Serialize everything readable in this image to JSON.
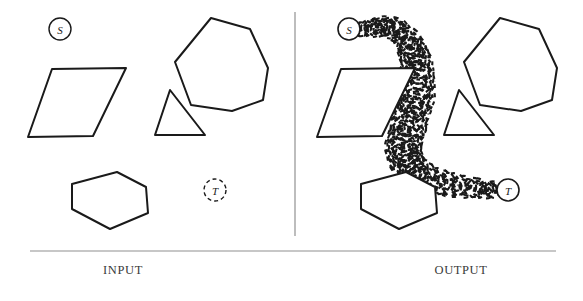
{
  "figure": {
    "background_color": "#ffffff",
    "stroke_color": "#1a1a1a",
    "divider_color": "#9a9a9a",
    "caption_color": "#3a3a3a",
    "width": 583,
    "height": 301
  },
  "panels": [
    {
      "id": "input",
      "caption": "INPUT",
      "caption_x": 123,
      "caption_y": 263,
      "start_marker": {
        "label": "S",
        "cx": 60,
        "cy": 29,
        "r": 11,
        "dashed": false
      },
      "goal_marker": {
        "label": "T",
        "cx": 215,
        "cy": 190,
        "r": 11,
        "dashed": true
      },
      "obstacles": [
        {
          "name": "parallelogram",
          "points": "52,69 126,68 93,136 28,137"
        },
        {
          "name": "heptagon",
          "points": "211,18 250,29 268,68 263,100 232,111 191,105 175,62"
        },
        {
          "name": "triangle",
          "points": "170,90 205,135 155,135"
        },
        {
          "name": "pentagon",
          "points": "117,172 146,187 148,213 110,229 72,209 72,184"
        }
      ]
    },
    {
      "id": "output",
      "caption": "OUTPUT",
      "caption_x": 461,
      "caption_y": 263,
      "start_marker": {
        "label": "S",
        "cx": 349,
        "cy": 29,
        "r": 11,
        "dashed": false
      },
      "goal_marker": {
        "label": "T",
        "cx": 508,
        "cy": 190,
        "r": 11,
        "dashed": false
      },
      "obstacles": [
        {
          "name": "parallelogram",
          "points": "341,69 415,68 382,136 317,137"
        },
        {
          "name": "heptagon",
          "points": "500,18 539,29 557,68 552,100 521,111 480,105 464,62"
        },
        {
          "name": "triangle",
          "points": "459,90 494,135 444,135"
        },
        {
          "name": "pentagon",
          "points": "406,172 435,187 437,213 399,229 361,209 361,184"
        }
      ],
      "path": {
        "name": "dashed-corridor-path",
        "style": "dashed",
        "from": "S",
        "to": "T",
        "waypoints": "361,30 380,26 398,31 410,45 416,64 418,86 414,108 407,130 403,152 412,169 432,180 455,186 478,189 496,190"
      }
    }
  ],
  "divider": {
    "name": "vertical-divider",
    "x": 295,
    "y1": 12,
    "y2": 236
  },
  "rule": {
    "name": "horizontal-rule",
    "x1": 30,
    "x2": 556,
    "y": 251
  }
}
